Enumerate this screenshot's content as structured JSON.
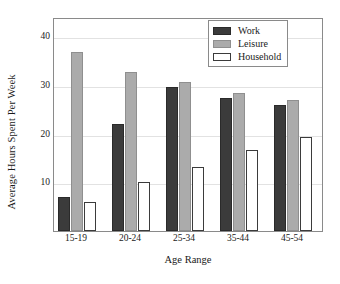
{
  "chart_data": {
    "type": "bar",
    "title": "",
    "xlabel": "Age Range",
    "ylabel": "Average Hours Spent Per Week",
    "categories": [
      "15-19",
      "20-24",
      "25-34",
      "35-44",
      "45-54"
    ],
    "series": [
      {
        "name": "Work",
        "color": "#3b3b3b",
        "values": [
          6.9,
          22.0,
          29.7,
          27.3,
          26.0
        ]
      },
      {
        "name": "Leisure",
        "color": "#ababab",
        "values": [
          36.8,
          32.7,
          30.6,
          28.4,
          27.0
        ]
      },
      {
        "name": "Household",
        "color": "#ffffff",
        "values": [
          6.0,
          10.0,
          13.2,
          16.7,
          19.3
        ]
      }
    ],
    "ylim": [
      0,
      44
    ],
    "yticks": [
      10,
      20,
      30,
      40
    ],
    "ytick_labels": [
      "10",
      "20",
      "30",
      "40"
    ],
    "grid": true,
    "legend_position": "top-right"
  },
  "legend": {
    "entries": [
      {
        "label": "Work"
      },
      {
        "label": "Leisure"
      },
      {
        "label": "Household"
      }
    ]
  }
}
